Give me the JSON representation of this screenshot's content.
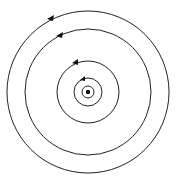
{
  "diagram": {
    "type": "concentric-circles",
    "center": [
      88,
      92
    ],
    "circles": [
      {
        "r": 81,
        "arrow": true
      },
      {
        "r": 63,
        "arrow": true
      },
      {
        "r": 31,
        "arrow": true
      },
      {
        "r": 14,
        "arrow": true
      },
      {
        "r": 6,
        "arrow": false
      }
    ],
    "center_dot_radius": 2,
    "stroke_color": "#222222"
  }
}
